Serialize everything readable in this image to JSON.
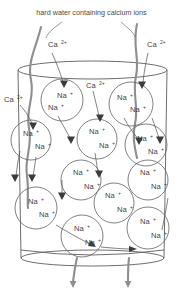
{
  "figure": {
    "caption": "hard water containing calcium ions",
    "title": "hard water containing calcium ions",
    "background_color": "#ffffff",
    "line_color": "#5e5e5e",
    "stream_color": "#8e8e8e",
    "text_color": "#3f3f3f"
  },
  "labels": {
    "calcium": {
      "base": "Ca",
      "charge": "2+"
    },
    "sodium": {
      "base": "Na",
      "charge": "+"
    }
  },
  "callouts": [
    {
      "id": "ca-top-left",
      "base": "Ca",
      "charge": "2+",
      "x": 48,
      "y": 44
    },
    {
      "id": "ca-top-right",
      "base": "Ca",
      "charge": "2+",
      "x": 147,
      "y": 44
    },
    {
      "id": "ca-mid-left",
      "base": "Ca",
      "charge": "2+",
      "x": 13,
      "y": 99
    },
    {
      "id": "ca-mid-top",
      "base": "Ca",
      "charge": "2+",
      "x": 86,
      "y": 85
    }
  ],
  "beads": [
    {
      "id": "bead-1",
      "cx": 62,
      "cy": 100,
      "r": 21,
      "ions": [
        {
          "x": 57,
          "y": 98
        },
        {
          "x": 48,
          "y": 110
        }
      ]
    },
    {
      "id": "bead-2",
      "cx": 131,
      "cy": 104,
      "r": 22,
      "ions": [
        {
          "x": 117,
          "y": 100
        },
        {
          "x": 130,
          "y": 112
        }
      ]
    },
    {
      "id": "bead-3",
      "cx": 31,
      "cy": 140,
      "r": 20,
      "ions": [
        {
          "x": 23,
          "y": 136
        },
        {
          "x": 35,
          "y": 149
        }
      ]
    },
    {
      "id": "bead-4",
      "cx": 97,
      "cy": 139,
      "r": 20,
      "ions": [
        {
          "x": 89,
          "y": 134
        },
        {
          "x": 99,
          "y": 148
        }
      ]
    },
    {
      "id": "bead-5",
      "cx": 146,
      "cy": 145,
      "r": 21,
      "ions": [
        {
          "x": 137,
          "y": 141
        },
        {
          "x": 148,
          "y": 154
        }
      ]
    },
    {
      "id": "bead-6",
      "cx": 81,
      "cy": 180,
      "r": 20,
      "ions": [
        {
          "x": 73,
          "y": 175
        },
        {
          "x": 84,
          "y": 189
        }
      ]
    },
    {
      "id": "bead-7",
      "cx": 148,
      "cy": 180,
      "r": 20,
      "ions": [
        {
          "x": 140,
          "y": 175
        },
        {
          "x": 151,
          "y": 189
        }
      ]
    },
    {
      "id": "bead-8",
      "cx": 114,
      "cy": 203,
      "r": 20,
      "ions": [
        {
          "x": 105,
          "y": 198
        },
        {
          "x": 117,
          "y": 212
        }
      ]
    },
    {
      "id": "bead-9",
      "cx": 36,
      "cy": 208,
      "r": 21,
      "ions": [
        {
          "x": 28,
          "y": 204
        },
        {
          "x": 39,
          "y": 217
        }
      ]
    },
    {
      "id": "bead-10",
      "cx": 82,
      "cy": 236,
      "r": 21,
      "ions": [
        {
          "x": 74,
          "y": 231
        },
        {
          "x": 85,
          "y": 245
        }
      ]
    },
    {
      "id": "bead-11",
      "cx": 148,
      "cy": 228,
      "r": 21,
      "ions": [
        {
          "x": 140,
          "y": 224
        },
        {
          "x": 151,
          "y": 238
        }
      ]
    }
  ],
  "vessel": {
    "top_y": 70,
    "bottom_y": 260,
    "left_x": 18,
    "right_x": 167,
    "ellipse_ry": 9
  },
  "streams": [
    {
      "id": "inlet-left",
      "label": "hard-water-inlet-left"
    },
    {
      "id": "inlet-right",
      "label": "hard-water-inlet-right"
    },
    {
      "id": "outlet-left",
      "label": "softened-water-outlet-left"
    },
    {
      "id": "outlet-right",
      "label": "softened-water-outlet-right"
    }
  ]
}
